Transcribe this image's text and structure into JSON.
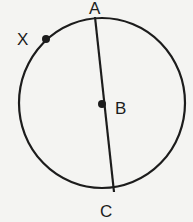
{
  "diagram": {
    "colors": {
      "background": "#f4f4f2",
      "stroke": "#1c1c1c"
    },
    "circle": {
      "cx": 102,
      "cy": 103,
      "rx": 83,
      "ry": 85
    },
    "chord": {
      "from": "A",
      "to": "C",
      "x1": 95,
      "y1": 17,
      "x2": 114,
      "y2": 192
    },
    "points": [
      {
        "name": "A",
        "label": "A",
        "x": 95,
        "y": 17,
        "dot": false
      },
      {
        "name": "B",
        "label": "B",
        "x": 102,
        "y": 104,
        "dot": true
      },
      {
        "name": "C",
        "label": "C",
        "x": 114,
        "y": 190,
        "dot": false
      },
      {
        "name": "X",
        "label": "X",
        "x": 46,
        "y": 39,
        "dot": true
      }
    ],
    "labels": {
      "A": "A",
      "B": "B",
      "C": "C",
      "X": "X"
    }
  }
}
